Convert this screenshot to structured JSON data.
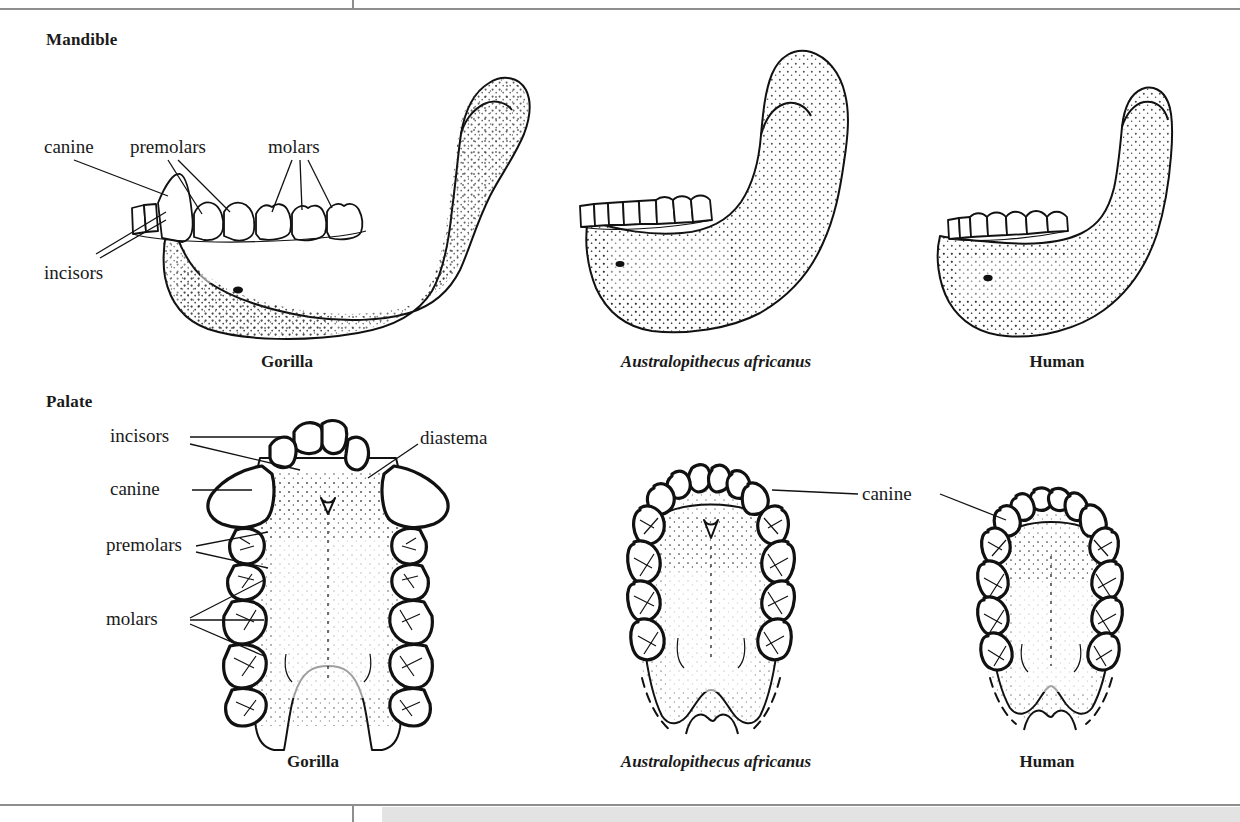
{
  "figure": {
    "sections": [
      {
        "id": "mandible",
        "heading": "Mandible"
      },
      {
        "id": "palate",
        "heading": "Palate"
      }
    ],
    "specimens": [
      "Gorilla",
      "Australopithecus africanus",
      "Human"
    ]
  },
  "mandible_row": {
    "heading": "Mandible",
    "labels": [
      {
        "name": "canine",
        "text": "canine"
      },
      {
        "name": "premolars",
        "text": "premolars"
      },
      {
        "name": "molars",
        "text": "molars"
      },
      {
        "name": "incisors",
        "text": "incisors"
      }
    ],
    "captions": [
      {
        "name": "gorilla",
        "text": "Gorilla",
        "style": "bold"
      },
      {
        "name": "australopith",
        "text": "Australopithecus africanus",
        "style": "bold-italic"
      },
      {
        "name": "human",
        "text": "Human",
        "style": "bold"
      }
    ]
  },
  "palate_row": {
    "heading": "Palate",
    "labels": [
      {
        "name": "incisors",
        "text": "incisors"
      },
      {
        "name": "canine",
        "text": "canine"
      },
      {
        "name": "premolars",
        "text": "premolars"
      },
      {
        "name": "molars",
        "text": "molars"
      },
      {
        "name": "diastema",
        "text": "diastema"
      },
      {
        "name": "canine-right",
        "text": "canine"
      }
    ],
    "captions": [
      {
        "name": "gorilla",
        "text": "Gorilla",
        "style": "bold"
      },
      {
        "name": "australopith",
        "text": "Australopithecus africanus",
        "style": "bold-italic"
      },
      {
        "name": "human",
        "text": "Human",
        "style": "bold"
      }
    ]
  },
  "colors": {
    "ink": "#111111",
    "rule": "#8e8e8e",
    "band": "#e3e3e3",
    "paper": "#ffffff"
  }
}
